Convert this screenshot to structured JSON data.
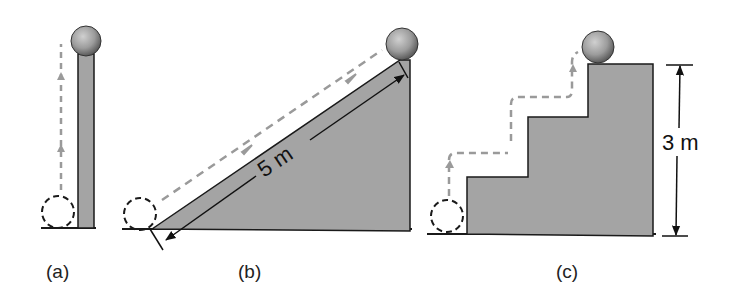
{
  "diagram": {
    "panels": [
      {
        "id": "a",
        "label": "(a)",
        "description": "Ball lifted vertically beside a tall thin column"
      },
      {
        "id": "b",
        "label": "(b)",
        "description": "Ball rolled up an inclined ramp",
        "dimension": "5 m"
      },
      {
        "id": "c",
        "label": "(c)",
        "description": "Ball carried up a staircase of three steps",
        "dimension": "3 m"
      }
    ],
    "colors": {
      "fill": "#a4a4a4",
      "stroke": "#1a1a1a",
      "path": "#9a9a9a",
      "ball": "#9c9c9c",
      "background": "#ffffff"
    }
  }
}
